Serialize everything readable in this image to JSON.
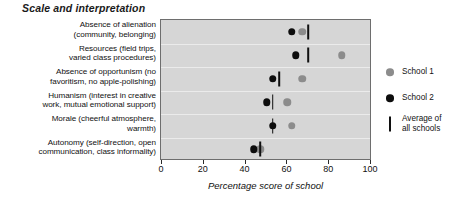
{
  "chart_data": {
    "type": "scatter",
    "title": "Scale and interpretation",
    "xlabel": "Percentage score of school",
    "ylabel": "",
    "xlim": [
      0,
      100
    ],
    "xticks": [
      0,
      20,
      40,
      60,
      80,
      100
    ],
    "grid": true,
    "legend_position": "right",
    "orientation": "horizontal",
    "categories": [
      "Absence of alienation (community, belonging)",
      "Resources (field trips, varied class procedures)",
      "Absence of opportunism (no favoritism, no apple-polishing)",
      "Humanism (interest in creative work, mutual emotional support)",
      "Morale (cheerful atmosphere, warmth)",
      "Autonomy (self-direction, open communication, class informality)"
    ],
    "category_lines": [
      [
        "Absence of alienation",
        "(community, belonging)"
      ],
      [
        "Resources (field trips,",
        "varied class procedures)"
      ],
      [
        "Absence of opportunism (no",
        "favoritism, no apple-polishing)"
      ],
      [
        "Humanism (interest in creative",
        "work, mutual emotional support)"
      ],
      [
        "Morale (cheerful atmosphere,",
        "warmth)"
      ],
      [
        "Autonomy (self-direction, open",
        "communication, class informality)"
      ]
    ],
    "series": [
      {
        "name": "School 1",
        "marker": "circle",
        "color": "#8c8c8c",
        "values": [
          67,
          86,
          67,
          60,
          62,
          47
        ]
      },
      {
        "name": "School 2",
        "marker": "circle",
        "color": "#0d0d0d",
        "values": [
          62,
          64,
          53,
          50,
          53,
          44
        ]
      },
      {
        "name": "Average of all schools",
        "marker": "vertical-bar",
        "color": "#101010",
        "values": [
          70,
          70,
          56,
          53,
          53,
          47
        ]
      }
    ]
  },
  "legend": {
    "items": [
      {
        "label": "School 1",
        "swatch": "gray-dot-icon"
      },
      {
        "label": "School 2",
        "swatch": "black-dot-icon"
      },
      {
        "label": "Average of\nall schools",
        "swatch": "vertical-bar-icon"
      }
    ]
  }
}
